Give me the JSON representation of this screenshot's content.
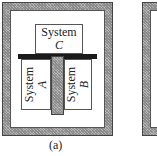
{
  "figure": {
    "panel_a": {
      "caption": "(a)",
      "system_c": {
        "word": "System",
        "letter": "C"
      },
      "system_a": {
        "word": "System",
        "letter": "A"
      },
      "system_b": {
        "word": "System",
        "letter": "B"
      }
    },
    "colors": {
      "insulation_hatch": "#b0b0b0",
      "diathermic_bar": "#1a1a1a",
      "outline": "#444444"
    }
  }
}
